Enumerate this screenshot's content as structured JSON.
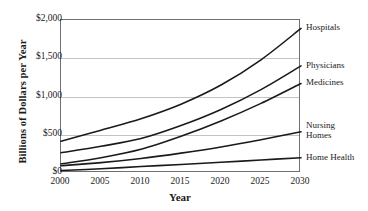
{
  "chart_data": {
    "type": "line",
    "title": "",
    "xlabel": "Year",
    "ylabel": "Billions of Dollars per Year",
    "xlim": [
      2000,
      2030
    ],
    "ylim": [
      0,
      2000
    ],
    "grid": true,
    "legend_position": "right-of-plot-at-line-end",
    "x": [
      2000,
      2005,
      2010,
      2015,
      2020,
      2025,
      2030
    ],
    "xtick_labels": [
      "2000",
      "2005",
      "2010",
      "2015",
      "2020",
      "2025",
      "2030"
    ],
    "ytick_values": [
      0,
      500,
      1000,
      1500,
      2000
    ],
    "ytick_labels": [
      "$0",
      "$500",
      "$1,000",
      "$1,500",
      "$2,000"
    ],
    "series": [
      {
        "name": "Hospitals",
        "label": "Hospitals",
        "values": [
          415,
          560,
          710,
          900,
          1150,
          1480,
          1890
        ]
      },
      {
        "name": "Physicians",
        "label": "Physicians",
        "values": [
          265,
          350,
          450,
          620,
          830,
          1090,
          1400
        ]
      },
      {
        "name": "Medicines",
        "label": "Medicines",
        "values": [
          120,
          200,
          310,
          480,
          680,
          910,
          1170
        ]
      },
      {
        "name": "Nursing Homes",
        "label": "Nursing\nHomes",
        "values": [
          95,
          135,
          190,
          260,
          340,
          435,
          540
        ]
      },
      {
        "name": "Home Health",
        "label": "Home Health",
        "values": [
          32,
          55,
          85,
          112,
          140,
          170,
          200
        ]
      }
    ],
    "line_color": "#1a1a1a"
  }
}
